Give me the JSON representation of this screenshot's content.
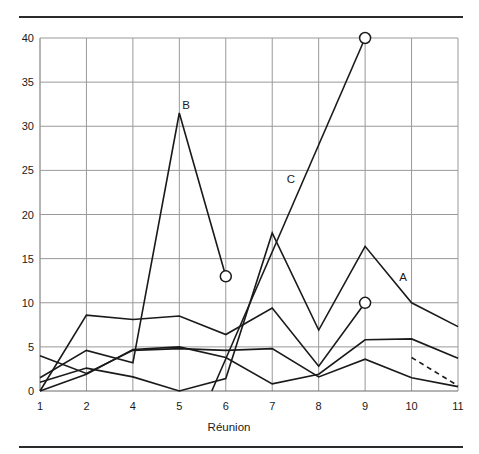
{
  "chart_data": {
    "type": "line",
    "title": "",
    "xlabel": "Réunion",
    "ylabel": "",
    "x_ticks": [
      1,
      2,
      4,
      5,
      6,
      7,
      8,
      9,
      10,
      11
    ],
    "y_ticks": [
      0,
      5,
      10,
      15,
      20,
      25,
      30,
      35,
      40
    ],
    "ylim": [
      0,
      40
    ],
    "grid": true,
    "legend": "none",
    "series": [
      {
        "name": "A",
        "label": "A",
        "style": "solid",
        "end_marker": null,
        "x": [
          1,
          2,
          4,
          5,
          6,
          7,
          8,
          9,
          10,
          11
        ],
        "y": [
          1.0,
          2.6,
          1.6,
          0,
          1.4,
          17.9,
          6.9,
          16.4,
          10,
          7.3
        ]
      },
      {
        "name": "B",
        "label": "B",
        "style": "solid",
        "end_marker": "open-circle",
        "x": [
          1,
          2,
          4,
          5,
          6
        ],
        "y": [
          1.5,
          4.6,
          3.2,
          31.5,
          13
        ]
      },
      {
        "name": "C",
        "label": "C",
        "style": "solid",
        "end_marker": "open-circle",
        "x": [
          5.7,
          9
        ],
        "y": [
          0,
          40
        ]
      },
      {
        "name": "unlabeled-1",
        "label": "",
        "style": "solid",
        "end_marker": "open-circle",
        "x": [
          1,
          2,
          4,
          5,
          6,
          7,
          8,
          9
        ],
        "y": [
          0,
          8.6,
          8.1,
          8.5,
          6.4,
          9.4,
          2.8,
          10
        ]
      },
      {
        "name": "unlabeled-2",
        "label": "",
        "style": "solid",
        "end_marker": null,
        "x": [
          1,
          2,
          4,
          5,
          6,
          7,
          8,
          9,
          10,
          11
        ],
        "y": [
          0,
          1.9,
          4.7,
          5.0,
          3.8,
          0.8,
          1.9,
          5.8,
          5.9,
          3.7
        ]
      },
      {
        "name": "unlabeled-3",
        "label": "",
        "style": "solid",
        "end_marker": null,
        "x": [
          1,
          2,
          4,
          5,
          6,
          7,
          8,
          9,
          10,
          11
        ],
        "y": [
          4.0,
          2.0,
          4.6,
          4.8,
          4.6,
          4.8,
          1.6,
          3.6,
          1.5,
          0.5
        ]
      },
      {
        "name": "projection",
        "label": "",
        "style": "dashed",
        "end_marker": null,
        "x": [
          10,
          11
        ],
        "y": [
          3.8,
          0.6
        ]
      }
    ],
    "colors": {
      "line": "#1a1a1a",
      "grid": "#999999",
      "frame": "#6b6b6b",
      "text": "#1a1a1a",
      "background": "#ffffff",
      "rule": "#2b2b2b"
    }
  }
}
